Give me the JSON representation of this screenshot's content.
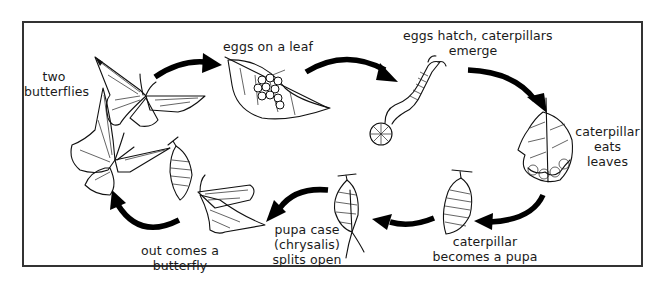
{
  "diagram": {
    "type": "cycle",
    "stages": [
      {
        "id": "two-butterflies",
        "label_lines": [
          "two",
          "butterflies"
        ]
      },
      {
        "id": "eggs-on-leaf",
        "label_lines": [
          "eggs on a leaf"
        ]
      },
      {
        "id": "eggs-hatch",
        "label_lines": [
          "eggs hatch, caterpillars",
          "emerge"
        ]
      },
      {
        "id": "caterpillar-eats",
        "label_lines": [
          "caterpillar",
          "eats",
          "leaves"
        ]
      },
      {
        "id": "becomes-pupa",
        "label_lines": [
          "caterpillar",
          "becomes a pupa"
        ]
      },
      {
        "id": "chrysalis-splits",
        "label_lines": [
          "pupa case",
          "(chrysalis)",
          "splits open"
        ]
      },
      {
        "id": "butterfly-emerges",
        "label_lines": [
          "out comes a",
          "butterfly"
        ]
      }
    ],
    "flow": [
      "two-butterflies",
      "eggs-on-leaf",
      "eggs-hatch",
      "caterpillar-eats",
      "becomes-pupa",
      "chrysalis-splits",
      "butterfly-emerges",
      "two-butterflies"
    ],
    "colors": {
      "ink": "#111111",
      "frame": "#333333",
      "background": "#ffffff"
    }
  }
}
